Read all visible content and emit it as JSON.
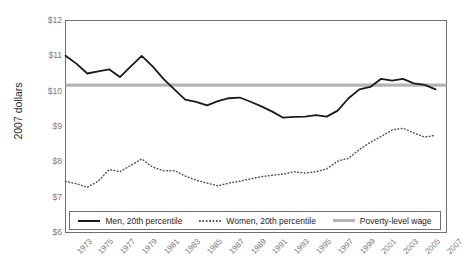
{
  "figure": {
    "title": "",
    "ylabel": "2007 dollars"
  },
  "legend": {
    "items": [
      {
        "label": "Men, 20th percentile",
        "style": "solid",
        "color": "#1a1a1a"
      },
      {
        "label": "Women, 20th percentile",
        "style": "dotted",
        "color": "#555555"
      },
      {
        "label": "Poverty-level wage",
        "style": "thick",
        "color": "#b4b4b4"
      }
    ]
  },
  "chart_data": {
    "type": "line",
    "title": "",
    "xlabel": "",
    "ylabel": "2007 dollars",
    "ylim": [
      6,
      12
    ],
    "ytick_labels": [
      "$6",
      "$7",
      "$8",
      "$9",
      "$10",
      "$11",
      "$12"
    ],
    "ytick_values": [
      6,
      7,
      8,
      9,
      10,
      11,
      12
    ],
    "xlim": [
      1973,
      2008
    ],
    "xtick_labels": [
      "1973",
      "1975",
      "1977",
      "1979",
      "1981",
      "1983",
      "1985",
      "1987",
      "1989",
      "1991",
      "1993",
      "1995",
      "1997",
      "1999",
      "2001",
      "2003",
      "2005",
      "2007"
    ],
    "xtick_values": [
      1973,
      1975,
      1977,
      1979,
      1981,
      1983,
      1985,
      1987,
      1989,
      1991,
      1993,
      1995,
      1997,
      1999,
      2001,
      2003,
      2005,
      2007
    ],
    "grid": false,
    "legend_position": "bottom-inside",
    "x": [
      1973,
      1974,
      1975,
      1976,
      1977,
      1978,
      1979,
      1980,
      1981,
      1982,
      1983,
      1984,
      1985,
      1986,
      1987,
      1988,
      1989,
      1990,
      1991,
      1992,
      1993,
      1994,
      1995,
      1996,
      1997,
      1998,
      1999,
      2000,
      2001,
      2002,
      2003,
      2004,
      2005,
      2006,
      2007
    ],
    "series": [
      {
        "name": "Men, 20th percentile",
        "style": "solid",
        "color": "#1a1a1a",
        "values": [
          11.0,
          10.78,
          10.5,
          10.56,
          10.62,
          10.4,
          10.7,
          11.0,
          10.7,
          10.35,
          10.05,
          9.76,
          9.7,
          9.6,
          9.72,
          9.8,
          9.82,
          9.7,
          9.57,
          9.42,
          9.25,
          9.27,
          9.28,
          9.32,
          9.28,
          9.45,
          9.8,
          10.05,
          10.12,
          10.35,
          10.3,
          10.35,
          10.22,
          10.18,
          10.05
        ]
      },
      {
        "name": "Women, 20th percentile",
        "style": "dotted",
        "color": "#555555",
        "values": [
          7.45,
          7.38,
          7.28,
          7.45,
          7.78,
          7.72,
          7.9,
          8.08,
          7.85,
          7.75,
          7.75,
          7.6,
          7.48,
          7.4,
          7.32,
          7.4,
          7.45,
          7.52,
          7.58,
          7.62,
          7.65,
          7.72,
          7.68,
          7.72,
          7.8,
          8.02,
          8.1,
          8.35,
          8.55,
          8.72,
          8.9,
          8.95,
          8.82,
          8.7,
          8.75
        ]
      }
    ],
    "reference_lines": [
      {
        "name": "Poverty-level wage",
        "value": 10.17,
        "orientation": "horizontal",
        "color": "#b4b4b4"
      }
    ]
  }
}
